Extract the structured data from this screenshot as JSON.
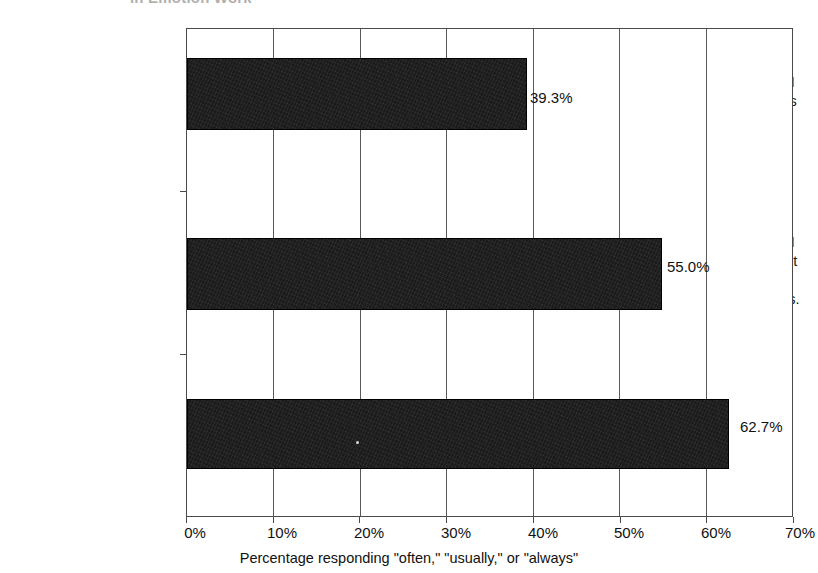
{
  "chart_data": {
    "type": "bar",
    "orientation": "horizontal",
    "title": "in Emotion Work",
    "categories": [
      "My job requires that I manage the emotions of others.",
      "My job requires that I display many different emotions when interacting with others.",
      "My work involves dealing with emotionally charged issues as a critical dimension of the job."
    ],
    "category_lines": [
      [
        "My job requires that I",
        "manage the emotions",
        "of others."
      ],
      [
        "My job requires that I",
        "display many different",
        "emotions when",
        "interacting with others."
      ],
      [
        "My work involves",
        "dealing with",
        "emotionally charged",
        "issues as a critical",
        "dimension of the job."
      ]
    ],
    "values": [
      39.3,
      55.0,
      62.7
    ],
    "value_labels": [
      "39.3%",
      "55.0%",
      "62.7%"
    ],
    "xlabel": "Percentage responding \"often,\" \"usually,\" or \"always\"",
    "ylabel": "",
    "xlim": [
      0,
      70
    ],
    "xticks": [
      0,
      10,
      20,
      30,
      40,
      50,
      60,
      70
    ],
    "xtick_labels": [
      "0%",
      "10%",
      "20%",
      "30%",
      "40%",
      "50%",
      "60%",
      "70%"
    ],
    "grid": "vertical",
    "legend": "none",
    "bar_color": "#1b1b1b",
    "axis_color": "#4a4a4a",
    "background": "#ffffff"
  }
}
